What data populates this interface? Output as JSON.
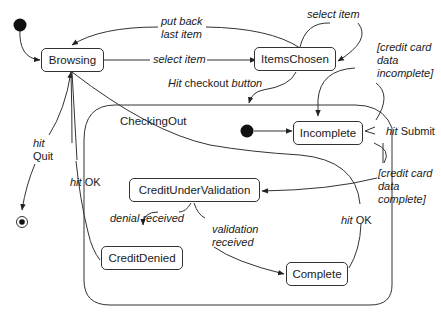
{
  "diagram": {
    "type": "UML state machine",
    "states": {
      "browsing": "Browsing",
      "items_chosen": "ItemsChosen",
      "checking_out": "CheckingOut",
      "incomplete": "Incomplete",
      "credit_under_validation": "CreditUnderValidation",
      "credit_denied": "CreditDenied",
      "complete": "Complete"
    },
    "transitions": {
      "put_back": [
        "put back",
        "last item"
      ],
      "select_item_1": "select item",
      "select_item_2": "select item",
      "hit_checkout": {
        "event": "Hit",
        "rest": " checkout ",
        "italic_tail": "button"
      },
      "cc_incomplete": [
        "[credit card",
        "data",
        "incomplete]"
      ],
      "hit_submit": {
        "event": "hit",
        "rest": " Submit"
      },
      "cc_complete": [
        "[credit card",
        "data",
        "complete]"
      ],
      "hit_quit": {
        "event": "hit",
        "rest": "Quit"
      },
      "hit_ok_left": {
        "event": "hit",
        "rest": " OK"
      },
      "hit_ok_right": {
        "event": "hit",
        "rest": " OK"
      },
      "denial_received": "denial received",
      "validation_received": [
        "validation",
        "received"
      ]
    },
    "colors": {
      "line": "#333333",
      "fill": "#111111",
      "background": "#ffffff"
    }
  }
}
